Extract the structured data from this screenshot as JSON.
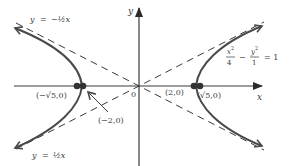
{
  "diagram": {
    "equation": {
      "x_num": "x",
      "x_exp": "2",
      "x_den": "4",
      "minus": "−",
      "y_num": "y",
      "y_exp": "2",
      "y_den": "1",
      "equals": "= 1"
    },
    "axes": {
      "x_label": "x",
      "y_label": "y",
      "origin_label": "0"
    },
    "asymptotes": [
      {
        "name": "upper-left",
        "label_lhs": "y",
        "label_eq": "=",
        "label_rhs": "−½x"
      },
      {
        "name": "lower-left",
        "label_lhs": "y",
        "label_eq": "=",
        "label_rhs": "½x"
      }
    ],
    "points": {
      "neg_sqrt5": "(−√5,0)",
      "neg_two": "(−2,0)",
      "pos_two": "(2,0)",
      "pos_sqrt5": "(√5,0)"
    },
    "colors": {
      "curve": "#4a4a4a",
      "axis": "#3a3a3a",
      "dash": "#3a3a3a",
      "dot": "#333333",
      "text": "#3a3a3a"
    }
  }
}
